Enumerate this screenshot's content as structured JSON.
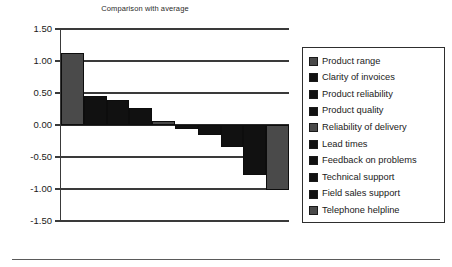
{
  "chart_data": {
    "type": "bar",
    "title": "Comparison with average",
    "xlabel": "",
    "ylabel": "",
    "ylim": [
      -1.5,
      1.5
    ],
    "ytick_labels": [
      "1.50",
      "1.00",
      "0.50",
      "0.00",
      "-0.50",
      "-1.00",
      "-1.50"
    ],
    "ytick_values": [
      1.5,
      1.0,
      0.5,
      0.0,
      -0.5,
      -1.0,
      -1.5
    ],
    "grid": true,
    "legend_position": "right",
    "categories": [
      "Product range",
      "Clarity of invoices",
      "Product reliability",
      "Product quality",
      "Reliability of delivery",
      "Lead times",
      "Feedback on problems",
      "Technical support",
      "Field sales support",
      "Telephone helpline"
    ],
    "values": [
      1.12,
      0.45,
      0.39,
      0.26,
      0.06,
      -0.07,
      -0.15,
      -0.35,
      -0.78,
      -1.02
    ],
    "bar_colors": [
      "#4a4a4a",
      "#111111",
      "#111111",
      "#111111",
      "#4a4a4a",
      "#111111",
      "#111111",
      "#111111",
      "#111111",
      "#4a4a4a"
    ]
  },
  "colors": {
    "gray": "#4a4a4a",
    "black": "#111111",
    "axis": "#3a3a3a",
    "legend_border": "#2e2e2e"
  }
}
